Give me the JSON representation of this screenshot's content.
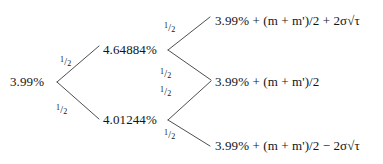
{
  "diagram": {
    "type": "binomial-tree",
    "title": "",
    "line_color": "#3a3a3a",
    "text_color": "#141414",
    "background": "#ffffff",
    "probability_label": "1/2",
    "probability_numerator": "1",
    "probability_slash": "/",
    "probability_denominator": "2",
    "nodes": {
      "root": "3.99%",
      "up": "4.64884%",
      "down": "4.01244%"
    },
    "leaves": {
      "top": "3.99% + (m + m')/2 + 2σ√τ",
      "middle": "3.99% + (m + m')/2",
      "bottom": "3.99% + (m + m')/2 − 2σ√τ"
    },
    "branches": [
      {
        "from": "root",
        "to": "up",
        "probability": "1/2"
      },
      {
        "from": "root",
        "to": "down",
        "probability": "1/2"
      },
      {
        "from": "up",
        "to": "top",
        "probability": "1/2"
      },
      {
        "from": "up",
        "to": "middle",
        "probability": "1/2"
      },
      {
        "from": "down",
        "to": "middle",
        "probability": "1/2"
      },
      {
        "from": "down",
        "to": "bottom",
        "probability": "1/2"
      }
    ]
  }
}
